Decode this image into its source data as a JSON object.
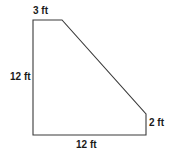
{
  "figure": {
    "name": "quadrilateral-with-dimension-labels",
    "shape_type": "trapezoid",
    "stroke_color": "#3a3a3a",
    "fill_color": "#ffffff",
    "background_color": "#ffffff",
    "unit": "ft",
    "vertices": [
      {
        "id": "top-left",
        "x": 33,
        "y": 20
      },
      {
        "id": "top-right",
        "x": 62,
        "y": 20
      },
      {
        "id": "right-upper",
        "x": 146,
        "y": 114
      },
      {
        "id": "right-lower",
        "x": 146,
        "y": 135
      },
      {
        "id": "bottom-left",
        "x": 33,
        "y": 135
      }
    ],
    "polygon_points": "33,20 62,20 146,114 146,135 33,135",
    "labels": {
      "top": "3 ft",
      "left": "12 ft",
      "bottom": "12 ft",
      "right": "2 ft"
    },
    "sides": [
      {
        "position": "top",
        "label": "3 ft",
        "value": 3,
        "unit": "ft"
      },
      {
        "position": "left",
        "label": "12 ft",
        "value": 12,
        "unit": "ft"
      },
      {
        "position": "bottom",
        "label": "12 ft",
        "value": 12,
        "unit": "ft"
      },
      {
        "position": "right",
        "label": "2 ft",
        "value": 2,
        "unit": "ft"
      },
      {
        "position": "diagonal",
        "label": "",
        "value": null,
        "unit": "ft"
      }
    ]
  }
}
